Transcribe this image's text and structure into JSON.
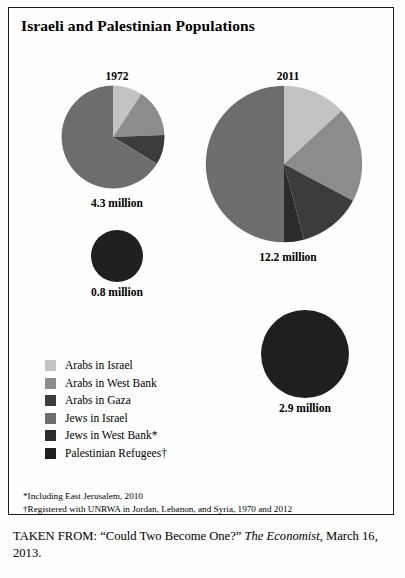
{
  "figure": {
    "title": "Israeli and Palestinian Populations"
  },
  "charts": {
    "pie_1972": {
      "year_label": "1972",
      "value_label": "4.3 million"
    },
    "pie_2011": {
      "year_label": "2011",
      "value_label": "12.2 million"
    },
    "refugees_1972": {
      "value_label": "0.8 million"
    },
    "refugees_2011": {
      "value_label": "2.9 million"
    }
  },
  "legend": {
    "items": [
      {
        "label": "Arabs in Israel",
        "color": "#c3c3c3"
      },
      {
        "label": "Arabs in West Bank",
        "color": "#8c8c8c"
      },
      {
        "label": "Arabs in Gaza",
        "color": "#3c3c3c"
      },
      {
        "label": "Jews in Israel",
        "color": "#6d6d6d"
      },
      {
        "label": "Jews in West Bank*",
        "color": "#2b2b2b"
      },
      {
        "label": "Palestinian Refugees†",
        "color": "#1f1f1f"
      }
    ]
  },
  "footnotes": [
    "*Including East Jerusalem, 2010",
    "†Registered with UNRWA in Jordan, Lebanon, and Syria, 1970 and 2012"
  ],
  "source": {
    "prefix": "TAKEN FROM: “Could Two Become One?” ",
    "publication": "The Economist",
    "suffix": ", March 16, 2013."
  },
  "chart_data": [
    {
      "type": "pie",
      "title": "1972",
      "total_label": "4.3 million",
      "total": 4.3,
      "unit": "million people",
      "start_angle_deg": 0,
      "direction": "clockwise",
      "categories": [
        "Arabs in Israel",
        "Arabs in West Bank",
        "Arabs in Gaza",
        "Jews in Israel"
      ],
      "values": [
        0.4,
        0.65,
        0.4,
        2.85
      ],
      "percentages": [
        9,
        15,
        9,
        67
      ],
      "colors": [
        "#c3c3c3",
        "#8c8c8c",
        "#3c3c3c",
        "#6d6d6d"
      ],
      "legend_position": "below-left",
      "grid": false
    },
    {
      "type": "pie",
      "title": "2011",
      "total_label": "12.2 million",
      "total": 12.2,
      "unit": "million people",
      "start_angle_deg": 0,
      "direction": "clockwise",
      "categories": [
        "Arabs in Israel",
        "Arabs in West Bank",
        "Arabs in Gaza",
        "Jews in West Bank",
        "Jews in Israel"
      ],
      "values": [
        1.6,
        2.4,
        1.6,
        0.5,
        6.1
      ],
      "percentages": [
        13,
        20,
        13,
        4,
        50
      ],
      "colors": [
        "#c3c3c3",
        "#8c8c8c",
        "#3c3c3c",
        "#2b2b2b",
        "#6d6d6d"
      ],
      "legend_position": "below-left",
      "grid": false
    },
    {
      "type": "pie",
      "title": "Palestinian Refugees 1970",
      "total_label": "0.8 million",
      "total": 0.8,
      "unit": "million people",
      "categories": [
        "Palestinian Refugees"
      ],
      "values": [
        0.8
      ],
      "percentages": [
        100
      ],
      "colors": [
        "#1f1f1f"
      ],
      "grid": false
    },
    {
      "type": "pie",
      "title": "Palestinian Refugees 2012",
      "total_label": "2.9 million",
      "total": 2.9,
      "unit": "million people",
      "categories": [
        "Palestinian Refugees"
      ],
      "values": [
        2.9
      ],
      "percentages": [
        100
      ],
      "colors": [
        "#1f1f1f"
      ],
      "grid": false
    }
  ]
}
